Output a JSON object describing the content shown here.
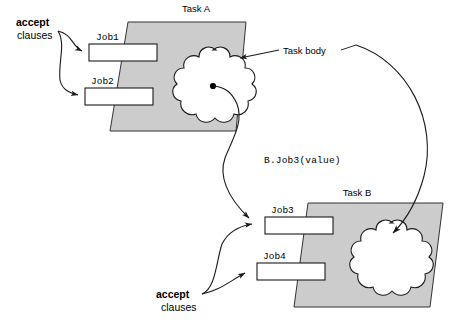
{
  "diagram": {
    "title_visible": false,
    "background_color": "#ffffff",
    "plane_fill": "#cccccc",
    "stroke_color": "#1a1a1a",
    "tasks": [
      {
        "id": "task-a",
        "label": "Task A",
        "label_x": 196,
        "label_y": 12,
        "plane": "128,22 246,22 236,131 110,131",
        "cloud_cx": 213,
        "cloud_cy": 86,
        "jobs": [
          {
            "name": "Job1",
            "label_x": 96,
            "label_y": 40,
            "box_x": 89,
            "box_y": 44,
            "box_w": 68,
            "box_h": 17
          },
          {
            "name": "Job2",
            "label_x": 91,
            "label_y": 84,
            "box_x": 85,
            "box_y": 88,
            "box_w": 68,
            "box_h": 17
          }
        ]
      },
      {
        "id": "task-b",
        "label": "Task B",
        "label_x": 357,
        "label_y": 196,
        "plane": "308,203 443,203 430,307 294,307",
        "cloud_cx": 390,
        "cloud_cy": 259,
        "jobs": [
          {
            "name": "Job3",
            "label_x": 271,
            "label_y": 213,
            "box_x": 265,
            "box_y": 217,
            "box_w": 68,
            "box_h": 17
          },
          {
            "name": "Job4",
            "label_x": 263,
            "label_y": 259,
            "box_x": 257,
            "box_y": 263,
            "box_w": 68,
            "box_h": 17
          }
        ]
      }
    ],
    "annotations": {
      "task_body": {
        "label": "Task body",
        "x": 283,
        "y": 54
      },
      "entry_call": {
        "label": "B.Job3(value)",
        "x": 264,
        "y": 163
      },
      "accept_top": {
        "bold_word": "accept",
        "regular_word": "clauses",
        "bold_x": 16,
        "bold_y": 26,
        "reg_x": 17,
        "reg_y": 39
      },
      "accept_bottom": {
        "bold_word": "accept",
        "regular_word": "clauses",
        "bold_x": 156,
        "bold_y": 298,
        "reg_x": 161,
        "reg_y": 311
      }
    },
    "icons": {
      "arrowhead": "arrowhead-icon",
      "cloud": "cloud-icon",
      "origin_dot": "origin-dot-icon"
    }
  }
}
